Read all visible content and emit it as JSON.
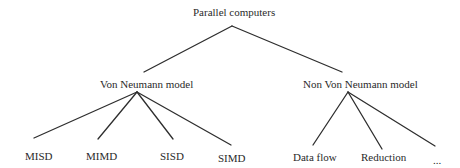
{
  "diagram": {
    "type": "tree",
    "root": {
      "label": "Parallel computers",
      "children": [
        {
          "label": "Von Neumann model",
          "children": [
            {
              "label": "MISD"
            },
            {
              "label": "MIMD"
            },
            {
              "label": "SISD"
            },
            {
              "label": "SIMD"
            }
          ]
        },
        {
          "label": "Non Von Neumann model",
          "children": [
            {
              "label": "Data flow"
            },
            {
              "label": "Reduction"
            },
            {
              "label": "..."
            }
          ]
        }
      ]
    }
  },
  "nodes": {
    "root": "Parallel computers",
    "von_neumann": "Von Neumann model",
    "non_von_neumann": "Non Von Neumann model",
    "misd": "MISD",
    "mimd": "MIMD",
    "sisd": "SISD",
    "simd": "SIMD",
    "data_flow": "Data flow",
    "reduction": "Reduction",
    "ellipsis": "..."
  },
  "colors": {
    "line": "#2e2e2e",
    "text": "#2a2a2a",
    "background": "#ffffff"
  }
}
